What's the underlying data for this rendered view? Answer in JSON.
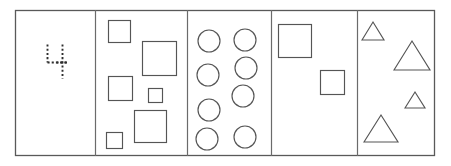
{
  "figure": {
    "canvas": {
      "width": 451,
      "height": 166
    },
    "frame": {
      "x": 15,
      "y": 10,
      "width": 420,
      "height": 146
    },
    "colors": {
      "background": "#ffffff",
      "frame_stroke": "#595959",
      "divider_stroke": "#6b6b6b",
      "shape_stroke": "#555555",
      "marker_stroke": "#2e2e2e"
    },
    "dividers_x": [
      95,
      187,
      271,
      357
    ],
    "panels": [
      {
        "name": "panel-marker",
        "index": 1,
        "shape_kind": "dashed-marker",
        "shape_count": 1,
        "bounds": {
          "x": 15,
          "y": 10,
          "width": 80,
          "height": 146
        },
        "marker": {
          "label": "dashed corner and crosshair",
          "vertical_left": {
            "x": 47,
            "y1": 44,
            "y2": 62
          },
          "horizontal_bottom": {
            "y": 62,
            "x1": 47,
            "x2": 68
          },
          "vertical_right": {
            "x": 62,
            "y1": 44,
            "y2": 78
          },
          "horizontal_cross": {
            "y": 62,
            "x1": 56,
            "x2": 68
          }
        }
      },
      {
        "name": "panel-squares-six",
        "index": 2,
        "shape_kind": "square",
        "shape_count": 6,
        "bounds": {
          "x": 95,
          "y": 10,
          "width": 92,
          "height": 146
        },
        "squares": [
          {
            "x": 108,
            "y": 20,
            "size": 22
          },
          {
            "x": 142,
            "y": 41,
            "size": 34
          },
          {
            "x": 108,
            "y": 76,
            "size": 24
          },
          {
            "x": 148,
            "y": 88,
            "size": 14
          },
          {
            "x": 134,
            "y": 110,
            "size": 32
          },
          {
            "x": 106,
            "y": 132,
            "size": 16
          }
        ]
      },
      {
        "name": "panel-circles-eight",
        "index": 3,
        "shape_kind": "circle",
        "shape_count": 8,
        "bounds": {
          "x": 187,
          "y": 10,
          "width": 84,
          "height": 146
        },
        "circles": [
          {
            "cx": 209,
            "cy": 41,
            "r": 11
          },
          {
            "cx": 245,
            "cy": 40,
            "r": 11
          },
          {
            "cx": 208,
            "cy": 75,
            "r": 11
          },
          {
            "cx": 246,
            "cy": 68,
            "r": 11
          },
          {
            "cx": 243,
            "cy": 96,
            "r": 11
          },
          {
            "cx": 209,
            "cy": 110,
            "r": 11
          },
          {
            "cx": 207,
            "cy": 139,
            "r": 11
          },
          {
            "cx": 245,
            "cy": 137,
            "r": 11
          }
        ]
      },
      {
        "name": "panel-squares-two",
        "index": 4,
        "shape_kind": "square",
        "shape_count": 2,
        "bounds": {
          "x": 271,
          "y": 10,
          "width": 86,
          "height": 146
        },
        "squares": [
          {
            "x": 278,
            "y": 24,
            "size": 33
          },
          {
            "x": 320,
            "y": 70,
            "size": 24
          }
        ]
      },
      {
        "name": "panel-triangles-four",
        "index": 5,
        "shape_kind": "triangle",
        "shape_count": 4,
        "bounds": {
          "x": 357,
          "y": 10,
          "width": 78,
          "height": 146
        },
        "triangles": [
          {
            "cx": 373,
            "base_y": 40,
            "half_width": 11,
            "height": 18
          },
          {
            "cx": 412,
            "base_y": 70,
            "half_width": 18,
            "height": 29
          },
          {
            "cx": 415,
            "base_y": 108,
            "half_width": 10,
            "height": 16
          },
          {
            "cx": 381,
            "base_y": 142,
            "half_width": 17,
            "height": 27
          }
        ]
      }
    ]
  }
}
